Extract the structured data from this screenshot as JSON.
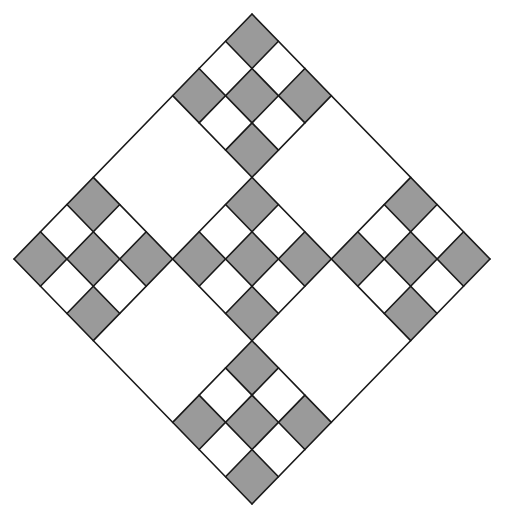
{
  "diagram": {
    "type": "rotated-checker-quilt",
    "geometry": {
      "center_x": 252,
      "center_y": 259,
      "half_width": 238,
      "half_height": 245
    },
    "grid_size": 3,
    "sub_grid_size": 3,
    "patterned_blocks": [
      {
        "name": "top",
        "u": 0,
        "v": 0
      },
      {
        "name": "right",
        "u": 2,
        "v": 0
      },
      {
        "name": "center",
        "u": 1,
        "v": 1
      },
      {
        "name": "left",
        "u": 0,
        "v": 2
      },
      {
        "name": "bottom",
        "u": 2,
        "v": 2
      }
    ],
    "shaded_sub_cells": [
      [
        0,
        0
      ],
      [
        2,
        0
      ],
      [
        1,
        1
      ],
      [
        0,
        2
      ],
      [
        2,
        2
      ]
    ],
    "colors": {
      "shade": "#9a9a9a",
      "background": "#ffffff",
      "stroke": "#1a1a1a"
    },
    "stroke_width": 1.6
  }
}
